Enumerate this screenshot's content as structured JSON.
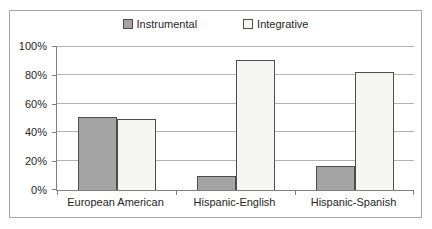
{
  "chart_data": {
    "type": "bar",
    "title": "",
    "xlabel": "",
    "ylabel": "",
    "categories": [
      "European American",
      "Hispanic-English",
      "Hispanic-Spanish"
    ],
    "series": [
      {
        "name": "Instrumental",
        "values": [
          51,
          10,
          17
        ],
        "fill": "#a4a4a4",
        "border": "#4d4d4d"
      },
      {
        "name": "Integrative",
        "values": [
          49,
          90,
          82
        ],
        "fill": "#f5f5f2",
        "border": "#4d4d4d"
      }
    ],
    "ylim": [
      0,
      100
    ],
    "ytick_step": 20,
    "yticks": [
      "0%",
      "20%",
      "40%",
      "60%",
      "80%",
      "100%"
    ],
    "grid": true,
    "legend_position": "top-center"
  },
  "colors": {
    "frame_border": "#a6a6a6",
    "gridline": "#b3b3b3",
    "axis": "#7f7f7f",
    "bar_border": "#4d4d4d",
    "instrumental_fill": "#a4a4a4",
    "integrative_fill": "#f5f5f2",
    "text": "#262626",
    "background": "#ffffff"
  }
}
